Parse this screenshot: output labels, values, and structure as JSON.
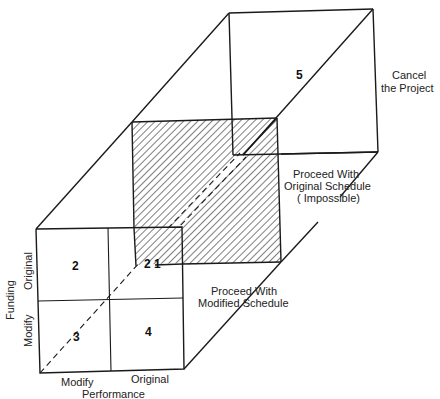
{
  "diagram": {
    "type": "3d-decision-cube",
    "axes": {
      "horizontal": {
        "title": "Performance",
        "ticks": [
          "Modify",
          "Original"
        ]
      },
      "vertical": {
        "title": "Funding",
        "ticks": [
          "Modify",
          "Original"
        ]
      },
      "depth": {
        "planes": [
          "Proceed With Modified Schedule",
          "Proceed With Original Schedule (Impossible)",
          "Cancel the Project"
        ]
      }
    },
    "regions": [
      {
        "id": "1",
        "label": "1"
      },
      {
        "id": "2",
        "label": "2"
      },
      {
        "id": "3",
        "label": "3"
      },
      {
        "id": "4",
        "label": "4"
      },
      {
        "id": "5",
        "label": "5"
      }
    ],
    "corner_label": "2 1",
    "labels": {
      "performance_title": "Performance",
      "performance_modify": "Modify",
      "performance_original": "Original",
      "funding_title": "Funding",
      "funding_modify": "Modify",
      "funding_original": "Original",
      "plane_modified_line1": "Proceed With",
      "plane_modified_line2": "Modified Schedule",
      "plane_original_line1": "Proceed With",
      "plane_original_line2": "Original Schedule",
      "plane_original_line3": "( Impossible)",
      "plane_cancel_line1": "Cancel",
      "plane_cancel_line2": "the Project"
    },
    "colors": {
      "line": "#1a1a1a",
      "hatch": "#2a2a2a",
      "background": "#ffffff"
    }
  }
}
